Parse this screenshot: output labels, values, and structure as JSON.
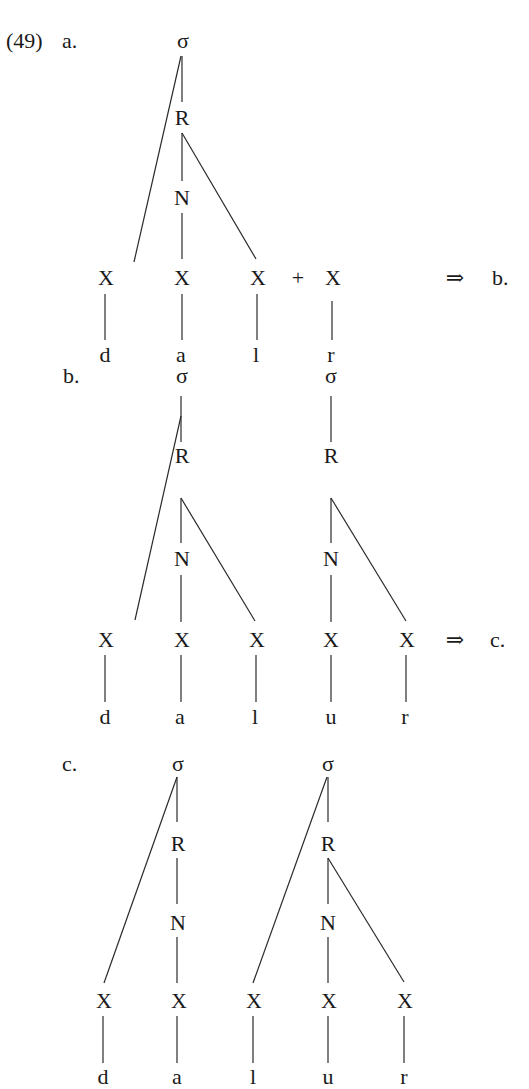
{
  "example_number": "(49)",
  "arrow_glyph": "⇒",
  "plus_glyph": "+",
  "panels": [
    {
      "label": "a.",
      "next_ref": "b.",
      "syllables": [
        {
          "sigma": "σ",
          "rhyme": "R",
          "nucleus": "N"
        }
      ],
      "timing_slots": [
        "X",
        "X",
        "X",
        "X"
      ],
      "segments": [
        "d",
        "a",
        "l",
        "r"
      ],
      "note": "dal + r (r unsyllabified, joined by +)"
    },
    {
      "label": "b.",
      "next_ref": "c.",
      "syllables": [
        {
          "sigma": "σ",
          "rhyme": "R",
          "nucleus": "N"
        },
        {
          "sigma": "σ",
          "rhyme": "R",
          "nucleus": "N"
        }
      ],
      "timing_slots": [
        "X",
        "X",
        "X",
        "X",
        "X"
      ],
      "segments": [
        "d",
        "a",
        "l",
        "u",
        "r"
      ]
    },
    {
      "label": "c.",
      "syllables": [
        {
          "sigma": "σ",
          "rhyme": "R",
          "nucleus": "N"
        },
        {
          "sigma": "σ",
          "rhyme": "R",
          "nucleus": "N"
        }
      ],
      "timing_slots": [
        "X",
        "X",
        "X",
        "X",
        "X"
      ],
      "segments": [
        "d",
        "a",
        "l",
        "u",
        "r"
      ]
    }
  ]
}
